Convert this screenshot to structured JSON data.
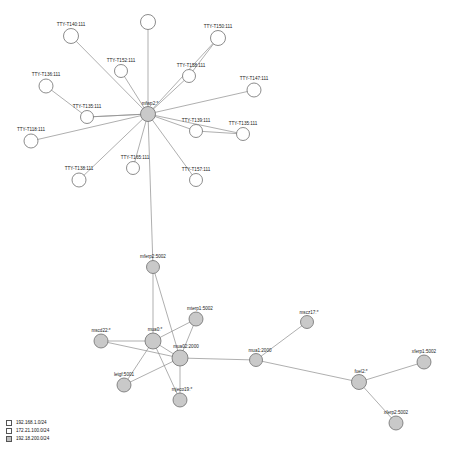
{
  "chart_data": {
    "type": "diagram",
    "title": "",
    "subtitle": "",
    "xlabel": "",
    "ylabel": "",
    "grid": false,
    "legend_position": "bottom-left",
    "node_fill_hub": "#c9c9c9",
    "node_fill_leaf": "#ffffff",
    "node_stroke": "#6e6e6e",
    "edge_color": "#8c8c8c",
    "nodes": [
      {
        "id": "n-tty-t140",
        "label": "TTY-T140:111",
        "x": 71,
        "y": 36,
        "r": 7.5,
        "filled": false,
        "label_dx": 0,
        "label_dy": -10,
        "anchor": "middle"
      },
      {
        "id": "n-top-blank",
        "label": "",
        "x": 148,
        "y": 22,
        "r": 7.5,
        "filled": false,
        "label_dx": 0,
        "label_dy": -10,
        "anchor": "middle"
      },
      {
        "id": "n-tty-t150",
        "label": "TTY-T150:111",
        "x": 218,
        "y": 38,
        "r": 7.5,
        "filled": false,
        "label_dx": 0,
        "label_dy": -10,
        "anchor": "middle"
      },
      {
        "id": "n-tty-t152",
        "label": "TTY-T152:111",
        "x": 121,
        "y": 71,
        "r": 6.5,
        "filled": false,
        "label_dx": 0,
        "label_dy": -9,
        "anchor": "middle"
      },
      {
        "id": "n-tty-t158",
        "label": "TTY-T158:111",
        "x": 189,
        "y": 76,
        "r": 6.5,
        "filled": false,
        "label_dx": 2,
        "label_dy": -9,
        "anchor": "middle"
      },
      {
        "id": "n-tty-t136",
        "label": "TTY-T136:111",
        "x": 46,
        "y": 86,
        "r": 7,
        "filled": false,
        "label_dx": 0,
        "label_dy": -10,
        "anchor": "middle"
      },
      {
        "id": "n-tty-t147",
        "label": "TTY-T147:111",
        "x": 254,
        "y": 90,
        "r": 7,
        "filled": false,
        "label_dx": 0,
        "label_dy": -10,
        "anchor": "middle"
      },
      {
        "id": "n-tty-t135b",
        "label": "TTY-T135:111",
        "x": 87,
        "y": 117,
        "r": 6.5,
        "filled": false,
        "label_dx": 0,
        "label_dy": -9,
        "anchor": "middle"
      },
      {
        "id": "n-mfwp2",
        "label": "mfwp2:*",
        "x": 148,
        "y": 114,
        "r": 7.5,
        "filled": true,
        "label_dx": 2,
        "label_dy": -9,
        "anchor": "middle"
      },
      {
        "id": "n-tty-t139",
        "label": "TTY-T139:111",
        "x": 196,
        "y": 131,
        "r": 6.5,
        "filled": false,
        "label_dx": 0,
        "label_dy": -9,
        "anchor": "middle"
      },
      {
        "id": "n-tty-t135",
        "label": "TTY-T135:111",
        "x": 243,
        "y": 134,
        "r": 6.5,
        "filled": false,
        "label_dx": 0,
        "label_dy": -9,
        "anchor": "middle"
      },
      {
        "id": "n-tty-t118",
        "label": "TTY-T118:111",
        "x": 31,
        "y": 141,
        "r": 7,
        "filled": false,
        "label_dx": 0,
        "label_dy": -10,
        "anchor": "middle"
      },
      {
        "id": "n-tty-t165",
        "label": "TTY-T165:111",
        "x": 133,
        "y": 168,
        "r": 6.5,
        "filled": false,
        "label_dx": 2,
        "label_dy": -9,
        "anchor": "middle"
      },
      {
        "id": "n-tty-t157",
        "label": "TTY-T157:111",
        "x": 196,
        "y": 180,
        "r": 6.5,
        "filled": false,
        "label_dx": 0,
        "label_dy": -9,
        "anchor": "middle"
      },
      {
        "id": "n-tty-t138",
        "label": "TTY-T138:111",
        "x": 79,
        "y": 180,
        "r": 7,
        "filled": false,
        "label_dx": 0,
        "label_dy": -10,
        "anchor": "middle"
      },
      {
        "id": "n-mferp2",
        "label": "mferp2:5002",
        "x": 153,
        "y": 267,
        "r": 6.5,
        "filled": true,
        "label_dx": 0,
        "label_dy": -9,
        "anchor": "middle"
      },
      {
        "id": "n-mterp1",
        "label": "mterp1:5002",
        "x": 196,
        "y": 319,
        "r": 7,
        "filled": true,
        "label_dx": 4,
        "label_dy": -9,
        "anchor": "middle"
      },
      {
        "id": "n-mscd22",
        "label": "mscd22:*",
        "x": 101,
        "y": 341,
        "r": 7,
        "filled": true,
        "label_dx": 0,
        "label_dy": -9,
        "anchor": "middle"
      },
      {
        "id": "n-mua0",
        "label": "mua0:*",
        "x": 153,
        "y": 341,
        "r": 8,
        "filled": true,
        "label_dx": 2,
        "label_dy": -10,
        "anchor": "middle"
      },
      {
        "id": "n-mua02",
        "label": "mua02:2000",
        "x": 180,
        "y": 358,
        "r": 8,
        "filled": true,
        "label_dx": 6,
        "label_dy": -10,
        "anchor": "middle"
      },
      {
        "id": "n-letgf",
        "label": "letgf:5001",
        "x": 124,
        "y": 385,
        "r": 7,
        "filled": true,
        "label_dx": 0,
        "label_dy": -9,
        "anchor": "middle"
      },
      {
        "id": "n-mjeco19",
        "label": "mjeco19:*",
        "x": 180,
        "y": 400,
        "r": 7,
        "filled": true,
        "label_dx": 2,
        "label_dy": -9,
        "anchor": "middle"
      },
      {
        "id": "n-mua1",
        "label": "mua1:2000",
        "x": 256,
        "y": 360,
        "r": 6.5,
        "filled": true,
        "label_dx": 4,
        "label_dy": -8,
        "anchor": "middle"
      },
      {
        "id": "n-mscz17",
        "label": "mscz17:*",
        "x": 307,
        "y": 322,
        "r": 6.5,
        "filled": true,
        "label_dx": 2,
        "label_dy": -8,
        "anchor": "middle"
      },
      {
        "id": "n-fuel2",
        "label": "fuel2:*",
        "x": 359,
        "y": 382,
        "r": 7.5,
        "filled": true,
        "label_dx": 2,
        "label_dy": -9,
        "anchor": "middle"
      },
      {
        "id": "n-xferp1",
        "label": "xferp1:5002",
        "x": 424,
        "y": 362,
        "r": 7,
        "filled": true,
        "label_dx": 0,
        "label_dy": -9,
        "anchor": "middle"
      },
      {
        "id": "n-xferp2",
        "label": "xferp2:5002",
        "x": 396,
        "y": 423,
        "r": 7,
        "filled": true,
        "label_dx": 0,
        "label_dy": -9,
        "anchor": "middle"
      }
    ],
    "edges": [
      {
        "from": "n-mfwp2",
        "to": "n-tty-t140"
      },
      {
        "from": "n-mfwp2",
        "to": "n-top-blank"
      },
      {
        "from": "n-mfwp2",
        "to": "n-tty-t150"
      },
      {
        "from": "n-mfwp2",
        "to": "n-tty-t152"
      },
      {
        "from": "n-mfwp2",
        "to": "n-tty-t158"
      },
      {
        "from": "n-mfwp2",
        "to": "n-tty-t147"
      },
      {
        "from": "n-mfwp2",
        "to": "n-tty-t135b"
      },
      {
        "from": "n-mfwp2",
        "to": "n-tty-t139"
      },
      {
        "from": "n-mfwp2",
        "to": "n-tty-t135"
      },
      {
        "from": "n-mfwp2",
        "to": "n-tty-t118"
      },
      {
        "from": "n-mfwp2",
        "to": "n-tty-t165"
      },
      {
        "from": "n-mfwp2",
        "to": "n-tty-t157"
      },
      {
        "from": "n-mfwp2",
        "to": "n-tty-t138"
      },
      {
        "from": "n-tty-t136",
        "to": "n-tty-t135b"
      },
      {
        "from": "n-tty-t135b",
        "to": "n-mfwp2"
      },
      {
        "from": "n-tty-t158",
        "to": "n-tty-t150"
      },
      {
        "from": "n-tty-t139",
        "to": "n-tty-t135"
      },
      {
        "from": "n-mfwp2",
        "to": "n-mferp2"
      },
      {
        "from": "n-mferp2",
        "to": "n-mua0"
      },
      {
        "from": "n-mferp2",
        "to": "n-mua02"
      },
      {
        "from": "n-mua0",
        "to": "n-mterp1"
      },
      {
        "from": "n-mua0",
        "to": "n-mscd22"
      },
      {
        "from": "n-mua0",
        "to": "n-mua02"
      },
      {
        "from": "n-mua0",
        "to": "n-letgf"
      },
      {
        "from": "n-mua0",
        "to": "n-mjeco19"
      },
      {
        "from": "n-mua02",
        "to": "n-mterp1"
      },
      {
        "from": "n-mua02",
        "to": "n-mscd22"
      },
      {
        "from": "n-mua02",
        "to": "n-letgf"
      },
      {
        "from": "n-mua02",
        "to": "n-mjeco19"
      },
      {
        "from": "n-mua02",
        "to": "n-mua1"
      },
      {
        "from": "n-mua1",
        "to": "n-mscz17"
      },
      {
        "from": "n-mua1",
        "to": "n-fuel2"
      },
      {
        "from": "n-fuel2",
        "to": "n-xferp1"
      },
      {
        "from": "n-fuel2",
        "to": "n-xferp2"
      }
    ]
  },
  "legend": {
    "items": [
      {
        "label": "192.168.1.0/24",
        "color": "#ffffff"
      },
      {
        "label": "172.21.100.0/24",
        "color": "#ffffff"
      },
      {
        "label": "192.18.200.0/24",
        "color": "#bfbfbf"
      }
    ]
  }
}
